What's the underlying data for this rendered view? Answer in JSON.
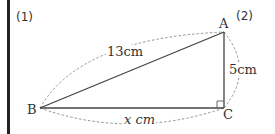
{
  "problem_labels": {
    "part1": "(1)",
    "part2": "(2)"
  },
  "vertices": {
    "A": {
      "label": "A",
      "x": 224,
      "y": 32
    },
    "B": {
      "label": "B",
      "x": 40,
      "y": 108
    },
    "C": {
      "label": "C",
      "x": 224,
      "y": 108
    }
  },
  "measurements": {
    "hypotenuse_AB": "13cm",
    "side_AC": "5cm",
    "side_BC": "x cm"
  },
  "right_angle_at": "C",
  "colors": {
    "line": "#444444",
    "dashed": "#888888",
    "text": "#333333",
    "border": "#222222"
  }
}
